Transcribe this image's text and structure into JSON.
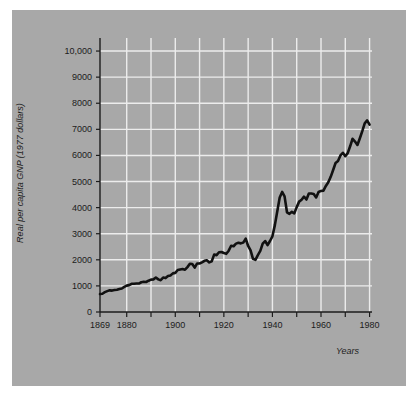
{
  "figure": {
    "background_color": "#ffffff",
    "panel_color": "#a8a8a8",
    "grid_color": "#ececec",
    "axis_color": "#1c1c1c",
    "line_color": "#111111"
  },
  "chart_data": {
    "type": "line",
    "title": "",
    "xlabel": "Years",
    "ylabel": "Real per capita GNP (1977 dollars)",
    "xlim": [
      1869,
      1981
    ],
    "ylim": [
      0,
      10500
    ],
    "grid": true,
    "legend": "none",
    "y_ticks": [
      0,
      1000,
      2000,
      3000,
      4000,
      5000,
      6000,
      7000,
      8000,
      9000,
      10000
    ],
    "y_tick_labels": [
      "0",
      "1000",
      "2000",
      "3000",
      "4000",
      "5000",
      "6000",
      "7000",
      "8000",
      "9000",
      "10,000"
    ],
    "x_ticks": [
      1869,
      1880,
      1890,
      1900,
      1910,
      1920,
      1930,
      1940,
      1950,
      1960,
      1970,
      1980
    ],
    "x_tick_labels": [
      "1869",
      "1880",
      "",
      "1900",
      "",
      "1920",
      "",
      "1940",
      "",
      "1960",
      "",
      "1980"
    ],
    "x_gridlines": [
      1880,
      1890,
      1900,
      1910,
      1920,
      1930,
      1940,
      1950,
      1960,
      1970,
      1980
    ],
    "series": [
      {
        "name": "Real per capita GNP",
        "x": [
          1869,
          1870,
          1871,
          1872,
          1873,
          1874,
          1875,
          1876,
          1877,
          1878,
          1879,
          1880,
          1881,
          1882,
          1883,
          1884,
          1885,
          1886,
          1887,
          1888,
          1889,
          1890,
          1891,
          1892,
          1893,
          1894,
          1895,
          1896,
          1897,
          1898,
          1899,
          1900,
          1901,
          1902,
          1903,
          1904,
          1905,
          1906,
          1907,
          1908,
          1909,
          1910,
          1911,
          1912,
          1913,
          1914,
          1915,
          1916,
          1917,
          1918,
          1919,
          1920,
          1921,
          1922,
          1923,
          1924,
          1925,
          1926,
          1927,
          1928,
          1929,
          1930,
          1931,
          1932,
          1933,
          1934,
          1935,
          1936,
          1937,
          1938,
          1939,
          1940,
          1941,
          1942,
          1943,
          1944,
          1945,
          1946,
          1947,
          1948,
          1949,
          1950,
          1951,
          1952,
          1953,
          1954,
          1955,
          1956,
          1957,
          1958,
          1959,
          1960,
          1961,
          1962,
          1963,
          1964,
          1965,
          1966,
          1967,
          1968,
          1969,
          1970,
          1971,
          1972,
          1973,
          1974,
          1975,
          1976,
          1977,
          1978,
          1979,
          1980
        ],
        "y": [
          690,
          700,
          760,
          800,
          830,
          820,
          840,
          850,
          880,
          900,
          960,
          1010,
          1030,
          1080,
          1080,
          1090,
          1090,
          1140,
          1160,
          1150,
          1200,
          1240,
          1250,
          1320,
          1250,
          1220,
          1320,
          1300,
          1380,
          1400,
          1480,
          1500,
          1610,
          1630,
          1650,
          1620,
          1720,
          1850,
          1840,
          1700,
          1860,
          1860,
          1900,
          1960,
          1980,
          1900,
          1940,
          2200,
          2180,
          2290,
          2300,
          2260,
          2230,
          2350,
          2540,
          2520,
          2620,
          2650,
          2630,
          2660,
          2810,
          2530,
          2360,
          2040,
          2000,
          2180,
          2340,
          2620,
          2720,
          2560,
          2720,
          2900,
          3330,
          3860,
          4390,
          4600,
          4430,
          3820,
          3760,
          3840,
          3780,
          4020,
          4230,
          4300,
          4420,
          4310,
          4540,
          4540,
          4520,
          4390,
          4600,
          4640,
          4650,
          4830,
          4970,
          5180,
          5440,
          5710,
          5790,
          6000,
          6100,
          5970,
          6090,
          6350,
          6640,
          6530,
          6400,
          6660,
          6930,
          7230,
          7340,
          7180
        ]
      }
    ],
    "annotations": [
      {
        "label": "1929 peak",
        "x": 1929,
        "y": 2810
      },
      {
        "label": "Great Depression trough",
        "x": 1933,
        "y": 2000
      },
      {
        "label": "World War II peak",
        "x": 1944,
        "y": 4600
      }
    ]
  }
}
